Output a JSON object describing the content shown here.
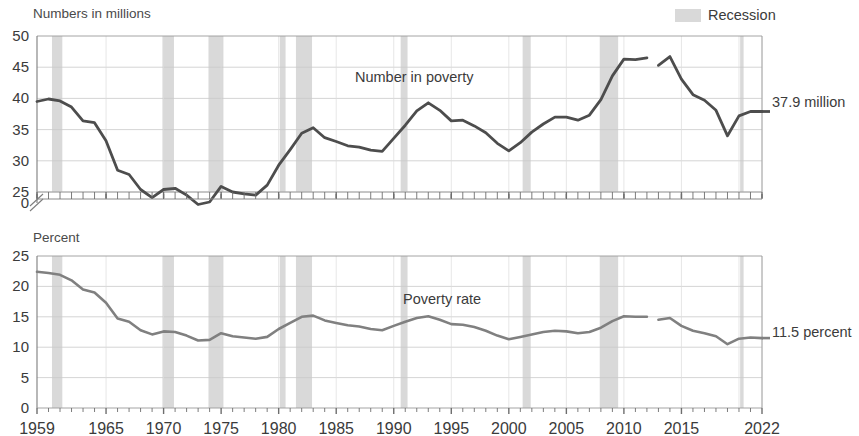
{
  "legend": {
    "recession_label": "Recession",
    "recession_color": "#d9d9d9"
  },
  "panels": {
    "top": {
      "axis_title": "Numbers in millions",
      "series_label": "Number in poverty",
      "end_value_label": "37.9 million",
      "y_ticks": [
        "50",
        "45",
        "40",
        "35",
        "30",
        "25",
        "0"
      ],
      "axis_break": true,
      "line_color": "#4d4d4d"
    },
    "bottom": {
      "axis_title": "Percent",
      "series_label": "Poverty rate",
      "end_value_label": "11.5 percent",
      "y_ticks": [
        "25",
        "20",
        "15",
        "10",
        "5",
        "0"
      ],
      "line_color": "#808080"
    }
  },
  "x_axis": {
    "tick_labels": [
      "1959",
      "1965",
      "1970",
      "1975",
      "1980",
      "1985",
      "1990",
      "1995",
      "2000",
      "2005",
      "2010",
      "2015",
      "2022"
    ],
    "tick_years": [
      1959,
      1965,
      1970,
      1975,
      1980,
      1985,
      1990,
      1995,
      2000,
      2005,
      2010,
      2015,
      2022
    ],
    "min": 1959,
    "max": 2022
  },
  "chart_data": {
    "type": "line",
    "xlabel": "",
    "panels": [
      {
        "name": "Number in poverty",
        "ylabel": "Numbers in millions",
        "ylim": [
          25,
          50
        ],
        "axis_break_below": 25,
        "grid": true,
        "legend_position": "inline-annotation",
        "end_label": "37.9 million",
        "x": [
          1959,
          1960,
          1961,
          1962,
          1963,
          1964,
          1965,
          1966,
          1967,
          1968,
          1969,
          1970,
          1971,
          1972,
          1973,
          1974,
          1975,
          1976,
          1977,
          1978,
          1979,
          1980,
          1981,
          1982,
          1983,
          1984,
          1985,
          1986,
          1987,
          1988,
          1989,
          1990,
          1991,
          1992,
          1993,
          1994,
          1995,
          1996,
          1997,
          1998,
          1999,
          2000,
          2001,
          2002,
          2003,
          2004,
          2005,
          2006,
          2007,
          2008,
          2009,
          2010,
          2011,
          2012,
          2013,
          2014,
          2015,
          2016,
          2017,
          2018,
          2019,
          2020,
          2021,
          2022
        ],
        "values": [
          39.5,
          39.9,
          39.6,
          38.6,
          36.4,
          36.1,
          33.2,
          28.5,
          27.8,
          25.4,
          24.1,
          25.4,
          25.6,
          24.5,
          23.0,
          23.4,
          25.9,
          25.0,
          24.7,
          24.5,
          26.1,
          29.3,
          31.8,
          34.4,
          35.3,
          33.7,
          33.1,
          32.4,
          32.2,
          31.7,
          31.5,
          33.6,
          35.7,
          38.0,
          39.3,
          38.1,
          36.4,
          36.5,
          35.6,
          34.5,
          32.8,
          31.6,
          32.9,
          34.6,
          35.9,
          37.0,
          37.0,
          36.5,
          37.3,
          39.8,
          43.6,
          46.3,
          46.2,
          46.5,
          45.3,
          46.7,
          43.1,
          40.6,
          39.7,
          38.1,
          34.0,
          37.2,
          37.9,
          37.9
        ],
        "break_at_year": 2013,
        "break_note": "Survey redesign break between 2012 and 2013 estimates"
      },
      {
        "name": "Poverty rate",
        "ylabel": "Percent",
        "ylim": [
          0,
          25
        ],
        "grid": true,
        "legend_position": "inline-annotation",
        "end_label": "11.5 percent",
        "x": [
          1959,
          1960,
          1961,
          1962,
          1963,
          1964,
          1965,
          1966,
          1967,
          1968,
          1969,
          1970,
          1971,
          1972,
          1973,
          1974,
          1975,
          1976,
          1977,
          1978,
          1979,
          1980,
          1981,
          1982,
          1983,
          1984,
          1985,
          1986,
          1987,
          1988,
          1989,
          1990,
          1991,
          1992,
          1993,
          1994,
          1995,
          1996,
          1997,
          1998,
          1999,
          2000,
          2001,
          2002,
          2003,
          2004,
          2005,
          2006,
          2007,
          2008,
          2009,
          2010,
          2011,
          2012,
          2013,
          2014,
          2015,
          2016,
          2017,
          2018,
          2019,
          2020,
          2021,
          2022
        ],
        "values": [
          22.4,
          22.2,
          21.9,
          21.0,
          19.5,
          19.0,
          17.3,
          14.7,
          14.2,
          12.8,
          12.1,
          12.6,
          12.5,
          11.9,
          11.1,
          11.2,
          12.3,
          11.8,
          11.6,
          11.4,
          11.7,
          13.0,
          14.0,
          15.0,
          15.2,
          14.4,
          14.0,
          13.6,
          13.4,
          13.0,
          12.8,
          13.5,
          14.2,
          14.8,
          15.1,
          14.5,
          13.8,
          13.7,
          13.3,
          12.7,
          11.9,
          11.3,
          11.7,
          12.1,
          12.5,
          12.7,
          12.6,
          12.3,
          12.5,
          13.2,
          14.3,
          15.1,
          15.0,
          15.0,
          14.5,
          14.8,
          13.5,
          12.7,
          12.3,
          11.8,
          10.5,
          11.4,
          11.6,
          11.5
        ],
        "break_at_year": 2013
      }
    ],
    "shaded_regions": {
      "label": "Recession",
      "color": "#d9d9d9",
      "periods": [
        {
          "start": 1960.3,
          "end": 1961.2
        },
        {
          "start": 1969.9,
          "end": 1970.9
        },
        {
          "start": 1973.9,
          "end": 1975.2
        },
        {
          "start": 1980.1,
          "end": 1980.6
        },
        {
          "start": 1981.5,
          "end": 1982.9
        },
        {
          "start": 1990.6,
          "end": 1991.2
        },
        {
          "start": 2001.2,
          "end": 2001.9
        },
        {
          "start": 2007.9,
          "end": 2009.5
        },
        {
          "start": 2020.1,
          "end": 2020.4
        }
      ]
    }
  }
}
